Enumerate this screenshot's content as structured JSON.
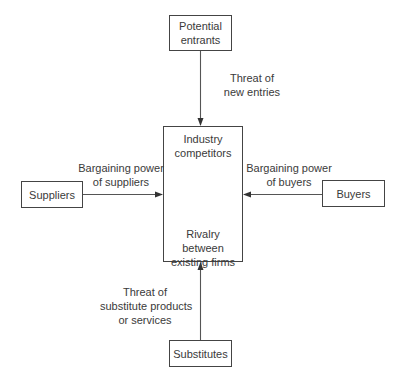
{
  "diagram": {
    "title": "",
    "nodes": {
      "top": {
        "line1": "Potential",
        "line2": "entrants"
      },
      "left": {
        "label": "Suppliers"
      },
      "right": {
        "label": "Buyers"
      },
      "bottom": {
        "label": "Substitutes"
      },
      "center": {
        "top_line1": "Industry",
        "top_line2": "competitors",
        "bottom_line1": "Rivalry between",
        "bottom_line2": "existing firms"
      }
    },
    "edges": {
      "top": {
        "line1": "Threat of",
        "line2": "new entries"
      },
      "left": {
        "line1": "Bargaining power",
        "line2": "of suppliers"
      },
      "right": {
        "line1": "Bargaining power",
        "line2": "of buyers"
      },
      "bottom": {
        "line1": "Threat of",
        "line2": "substitute products",
        "line3": "or services"
      }
    },
    "colors": {
      "line": "#444444",
      "text": "#3a3a3a",
      "background": "#ffffff"
    }
  }
}
